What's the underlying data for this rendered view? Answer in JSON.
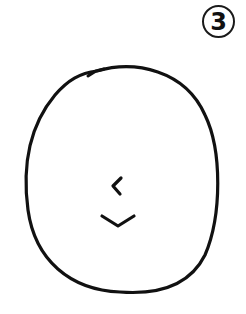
{
  "figure": {
    "label": "3",
    "stroke_color": "#111111",
    "background": "#ffffff",
    "shapes": {
      "head": "oval",
      "nose": "left-pointing chevron",
      "mouth": "downward chevron (smile)"
    }
  }
}
